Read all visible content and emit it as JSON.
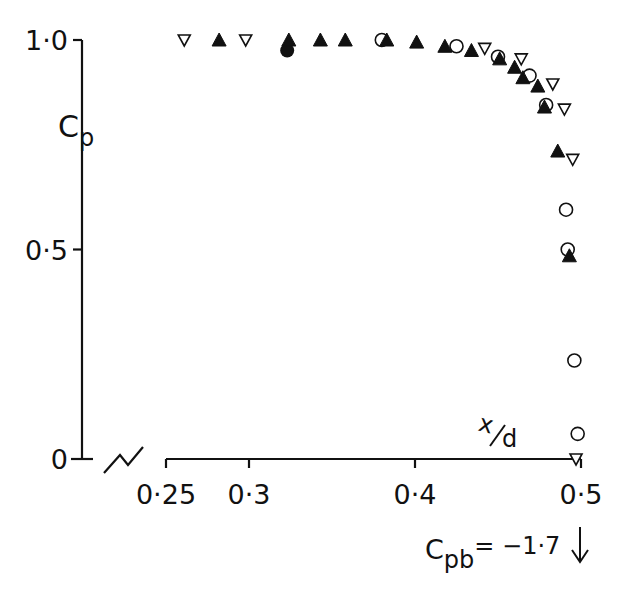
{
  "chart_data": {
    "type": "scatter",
    "title": "",
    "xlabel": "x/d",
    "ylabel": "Cp",
    "xlim": [
      0.25,
      0.5
    ],
    "ylim": [
      0,
      1.0
    ],
    "x_ticks": [
      0.25,
      0.3,
      0.4,
      0.5
    ],
    "x_tick_labels": [
      "0·25",
      "0·3",
      "0·4",
      "0·5"
    ],
    "y_ticks": [
      0,
      0.5,
      1.0
    ],
    "y_tick_labels": [
      "0",
      "0·5",
      "1·0"
    ],
    "grid": false,
    "legend": "none",
    "axis_break": "x-axis broken between 0 and 0.25",
    "annotation": {
      "text": "Cpb = −1·7",
      "arrow": "down",
      "x": 0.5
    },
    "series": [
      {
        "name": "open-inverted-triangle",
        "marker": "inverted-triangle-open",
        "points": [
          [
            0.261,
            1.0
          ],
          [
            0.298,
            1.0
          ],
          [
            0.442,
            0.98
          ],
          [
            0.464,
            0.955
          ],
          [
            0.483,
            0.895
          ],
          [
            0.49,
            0.835
          ],
          [
            0.495,
            0.715
          ],
          [
            0.497,
            0.0
          ]
        ]
      },
      {
        "name": "filled-triangle",
        "marker": "triangle-filled",
        "points": [
          [
            0.282,
            1.0
          ],
          [
            0.324,
            1.0
          ],
          [
            0.343,
            1.0
          ],
          [
            0.358,
            1.0
          ],
          [
            0.383,
            1.0
          ],
          [
            0.401,
            0.995
          ],
          [
            0.418,
            0.985
          ],
          [
            0.434,
            0.975
          ],
          [
            0.451,
            0.955
          ],
          [
            0.46,
            0.935
          ],
          [
            0.465,
            0.91
          ],
          [
            0.474,
            0.89
          ],
          [
            0.478,
            0.84
          ],
          [
            0.486,
            0.735
          ],
          [
            0.493,
            0.485
          ]
        ]
      },
      {
        "name": "open-circle",
        "marker": "circle-open",
        "points": [
          [
            0.38,
            1.0
          ],
          [
            0.425,
            0.985
          ],
          [
            0.45,
            0.96
          ],
          [
            0.469,
            0.915
          ],
          [
            0.479,
            0.845
          ],
          [
            0.491,
            0.595
          ],
          [
            0.492,
            0.5
          ],
          [
            0.496,
            0.235
          ],
          [
            0.498,
            0.06
          ]
        ]
      },
      {
        "name": "filled-circle",
        "marker": "circle-filled",
        "points": [
          [
            0.323,
            0.975
          ]
        ]
      }
    ]
  },
  "labels": {
    "y_axis_main": "C",
    "y_axis_sub": "p",
    "x_axis_num": "x",
    "x_axis_den": "d",
    "annotation_main": "C",
    "annotation_sub": "pb",
    "annotation_value": "= −1·7",
    "annotation_arrow": "↓"
  }
}
